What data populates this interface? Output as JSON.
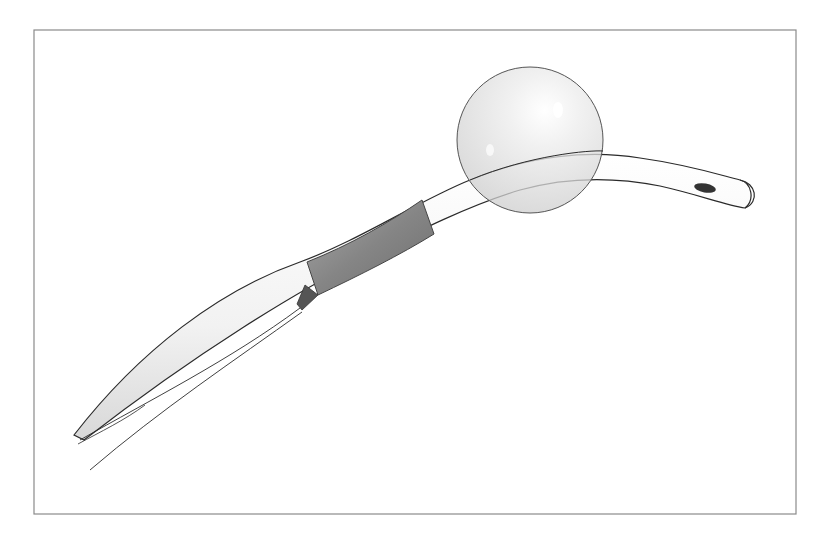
{
  "illustration": {
    "subject": "catheter-with-inflated-balloon",
    "colors": {
      "background": "#ffffff",
      "frame": "#8a8a8a",
      "tube_outline": "#2a2a2a",
      "tube_fill": "#f4f4f4",
      "sleeve": "#8c8c8c",
      "balloon_fill": "#e6e6e6",
      "drain_eye": "#333333"
    }
  }
}
